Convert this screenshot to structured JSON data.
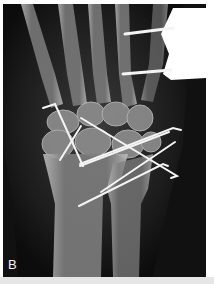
{
  "figure": {
    "panel_label": "B",
    "colors": {
      "background": "#0e0e0e",
      "bone": "#8a8a8a",
      "bone_cortex": "#c8c8c8",
      "wire": "#f4f4f4",
      "border": "#ffffff",
      "bottom_strip": "#e6e6e6"
    }
  }
}
